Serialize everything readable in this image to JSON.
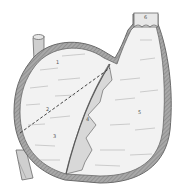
{
  "figure": {
    "labels": [
      {
        "id": "1",
        "text": "1",
        "x": 56,
        "y": 60
      },
      {
        "id": "2",
        "text": "2",
        "x": 46,
        "y": 107
      },
      {
        "id": "3",
        "text": "3",
        "x": 53,
        "y": 134
      },
      {
        "id": "4",
        "text": "4",
        "x": 86,
        "y": 117
      },
      {
        "id": "5",
        "text": "5",
        "x": 138,
        "y": 110
      },
      {
        "id": "6",
        "text": "6",
        "x": 144,
        "y": 15
      }
    ],
    "colors": {
      "outline": "#6a6a6a",
      "wall": "#9a9a9a",
      "fill": "#f2f2f2",
      "shade": "#d8d8d8",
      "hatch": "#b8b8b8"
    }
  }
}
